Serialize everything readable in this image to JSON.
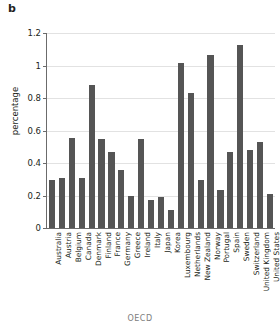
{
  "panel": {
    "letter": "b"
  },
  "chart_data": {
    "type": "bar",
    "title": "",
    "subtitle": "",
    "xlabel": "OECD",
    "ylabel": "percentage",
    "ylim": [
      0,
      1.2
    ],
    "yticks": [
      0,
      0.2,
      0.4,
      0.6,
      0.8,
      1,
      1.2
    ],
    "ytick_labels": [
      "0",
      "0.2",
      "0.4",
      "0.6",
      "0.8",
      "1",
      "1.2"
    ],
    "grid": "horizontal",
    "legend": "none",
    "bar_color": "#555555",
    "grid_color": "#e2e2e2",
    "axis_color": "#6b6b6b",
    "categories": [
      "Australia",
      "Austria",
      "Belgium",
      "Canada",
      "Denmark",
      "Finland",
      "France",
      "Germany",
      "Greece",
      "Ireland",
      "Italy",
      "Japan",
      "Korea",
      "Luxembourg",
      "Netherlands",
      "New Zealand",
      "Norway",
      "Portugal",
      "Spain",
      "Sweden",
      "Switzerland",
      "United Kingdom",
      "United States"
    ],
    "values": [
      0.295,
      0.305,
      0.555,
      0.305,
      0.88,
      0.545,
      0.465,
      0.36,
      0.2,
      0.545,
      0.17,
      0.19,
      0.11,
      1.015,
      0.83,
      0.295,
      1.065,
      0.235,
      0.465,
      1.125,
      0.48,
      0.53,
      0.21
    ]
  }
}
